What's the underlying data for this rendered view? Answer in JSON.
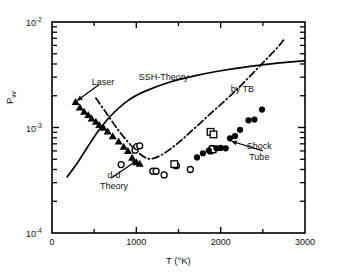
{
  "chart_data": {
    "type": "scatter",
    "title": "",
    "xlabel": "T (°K)",
    "ylabel": "P_vv",
    "ylabel_display": "Pvv",
    "xlim": [
      0,
      3000
    ],
    "ylim": [
      0.0001,
      0.01
    ],
    "yscale": "log",
    "xscale": "linear",
    "grid": false,
    "legend": "none (inline annotations with leader arrows)",
    "xticks": [
      0,
      1000,
      2000,
      3000
    ],
    "xtick_labels": [
      "0",
      "1000",
      "2000",
      "3000"
    ],
    "xminor_ticks": [
      500,
      1500,
      2500
    ],
    "yticks": [
      0.0001,
      0.001,
      0.01
    ],
    "ytick_labels": [
      "10-4",
      "10-3",
      "10-2"
    ],
    "ytick_mantissa": "10",
    "ytick_exponents": [
      "-2",
      "-3",
      "-4"
    ],
    "yminor_ticks": [
      0.0002,
      0.0003,
      0.0004,
      0.0005,
      0.0006,
      0.0007,
      0.0008,
      0.0009,
      0.002,
      0.003,
      0.004,
      0.005,
      0.006,
      0.007,
      0.008,
      0.009
    ],
    "series": [
      {
        "name": "Laser",
        "marker": "filled-triangle",
        "color": "#000000",
        "points": [
          [
            280,
            0.00175
          ],
          [
            330,
            0.00155
          ],
          [
            380,
            0.00142
          ],
          [
            430,
            0.00132
          ],
          [
            470,
            0.00122
          ],
          [
            520,
            0.00114
          ],
          [
            560,
            0.00106
          ],
          [
            610,
            0.001
          ],
          [
            660,
            0.00092
          ],
          [
            720,
            0.00083
          ],
          [
            790,
            0.00074
          ],
          [
            850,
            0.00066
          ],
          [
            900,
            0.0006
          ],
          [
            950,
            0.00052
          ],
          [
            1000,
            0.00047
          ],
          [
            1040,
            0.000455
          ]
        ]
      },
      {
        "name": "open-circles",
        "marker": "open-circle",
        "color": "#000000",
        "points": [
          [
            820,
            0.000445
          ],
          [
            985,
            0.00061
          ],
          [
            1005,
            0.00066
          ],
          [
            1040,
            0.00067
          ],
          [
            1195,
            0.000385
          ],
          [
            1235,
            0.000385
          ],
          [
            1330,
            0.000355
          ],
          [
            1455,
            0.00044
          ],
          [
            1475,
            0.000435
          ],
          [
            1640,
            0.0004
          ],
          [
            1880,
            0.0006
          ],
          [
            1900,
            0.000635
          ]
        ]
      },
      {
        "name": "open-squares",
        "marker": "open-square",
        "color": "#000000",
        "points": [
          [
            1450,
            0.00045
          ],
          [
            1880,
            0.00091
          ],
          [
            1915,
            0.00086
          ],
          [
            1905,
            0.00062
          ]
        ]
      },
      {
        "name": "Shock Tube",
        "marker": "filled-circle",
        "color": "#000000",
        "points": [
          [
            1720,
            0.00052
          ],
          [
            1790,
            0.00057
          ],
          [
            1860,
            0.000605
          ],
          [
            1950,
            0.000635
          ],
          [
            2000,
            0.00064
          ],
          [
            2060,
            0.000635
          ],
          [
            2110,
            0.00079
          ],
          [
            2170,
            0.00083
          ],
          [
            2230,
            0.00095
          ],
          [
            2330,
            0.00117
          ],
          [
            2400,
            0.00119
          ],
          [
            2490,
            0.00148
          ]
        ]
      }
    ],
    "curves": [
      {
        "name": "SSH-Theory",
        "style": "solid",
        "color": "#000000",
        "points": [
          [
            180,
            0.00034
          ],
          [
            300,
            0.00046
          ],
          [
            420,
            0.00065
          ],
          [
            560,
            0.00095
          ],
          [
            700,
            0.0013
          ],
          [
            900,
            0.0018
          ],
          [
            1100,
            0.0022
          ],
          [
            1400,
            0.0027
          ],
          [
            1700,
            0.0031
          ],
          [
            2000,
            0.00345
          ],
          [
            2350,
            0.0038
          ],
          [
            2700,
            0.0041
          ],
          [
            3000,
            0.0043
          ]
        ]
      },
      {
        "name": "d-d Theory / by TB",
        "style": "dash-dot",
        "color": "#000000",
        "points": [
          [
            520,
            0.0019
          ],
          [
            650,
            0.00135
          ],
          [
            780,
            0.00096
          ],
          [
            900,
            0.00073
          ],
          [
            1020,
            0.00058
          ],
          [
            1150,
            0.000505
          ],
          [
            1300,
            0.00055
          ],
          [
            1500,
            0.00072
          ],
          [
            1700,
            0.001
          ],
          [
            1900,
            0.0014
          ],
          [
            2100,
            0.00195
          ],
          [
            2300,
            0.0028
          ],
          [
            2500,
            0.0041
          ],
          [
            2680,
            0.0058
          ],
          [
            2760,
            0.007
          ]
        ]
      }
    ],
    "annotations": [
      {
        "text": "Laser",
        "x": 560,
        "y": 0.00255,
        "arrow_to": [
          300,
          0.0018
        ]
      },
      {
        "text": "SSH-Theory",
        "x": 1180,
        "y": 0.0028,
        "arrow_to": null
      },
      {
        "text": "by TB",
        "x": 2180,
        "y": 0.00215,
        "arrow_to": null
      },
      {
        "text": "Shock Tube",
        "x": 2500,
        "y": 0.0006,
        "arrow_to": [
          2130,
          0.00074
        ]
      },
      {
        "text": "d-d Theory",
        "x": 700,
        "y": 0.00033,
        "arrow_to": [
          1010,
          0.00049
        ]
      }
    ]
  },
  "labels": {
    "ytick_top_mantissa": "10",
    "ytick_top_exp": "-2",
    "ytick_mid_mantissa": "10",
    "ytick_mid_exp": "-3",
    "ytick_bot_mantissa": "10",
    "ytick_bot_exp": "-4",
    "xtick_0": "0",
    "xtick_1000": "1000",
    "xtick_2000": "2000",
    "xtick_3000": "3000",
    "xaxis_title": "T (°K)",
    "yaxis_title_main": "P",
    "yaxis_title_sub": "vv",
    "ann_laser": "Laser",
    "ann_ssh": "SSH-Theory",
    "ann_tb": "by TB",
    "ann_shock_1": "Shock",
    "ann_shock_2": "Tube",
    "ann_dd_1": "d-d",
    "ann_dd_2": "Theory"
  },
  "colors": {
    "ink": "#000000",
    "background": "#ffffff"
  }
}
